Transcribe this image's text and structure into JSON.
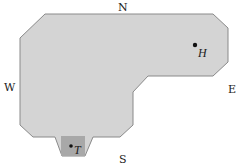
{
  "diagram": {
    "compass": {
      "north": "N",
      "south": "S",
      "east": "E",
      "west": "W"
    },
    "points": [
      {
        "label": "H",
        "description": "point H in upper-right lobe"
      },
      {
        "label": "T",
        "description": "point T in shaded square at bottom notch"
      }
    ],
    "colors": {
      "region_fill": "#d4d4d4",
      "region_stroke": "#8a8a8a",
      "square_fill": "#a8a8a8",
      "dot": "#111111",
      "text": "#222222"
    }
  }
}
